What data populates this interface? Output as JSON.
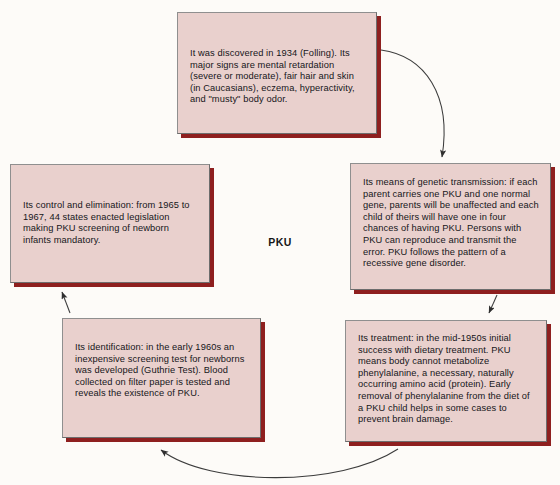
{
  "diagram": {
    "hub_label": "PKU",
    "title": "PKU",
    "type": "cycle-diagram",
    "colors": {
      "box_fill": "#e9d0cd",
      "box_shadow": "#8e1f1f",
      "box_border": "#8f8f8f",
      "background": "#fdfbf8",
      "text": "#16161a",
      "arrow": "#3a3a3a"
    },
    "nodes": [
      {
        "id": "discovery",
        "name": "discovery-box",
        "text": "It was discovered in 1934 (Folling). Its major signs are mental retardation (severe or moderate), fair hair and skin (in Caucasians), eczema, hyperactivity, and \"musty\" body odor."
      },
      {
        "id": "transmission",
        "name": "transmission-box",
        "text": "Its means of genetic transmission: if each parent carries one PKU and one normal gene, parents will be unaffected and each child of theirs will have one in four chances of having PKU. Persons with PKU can reproduce and transmit the error. PKU follows the pattern of a recessive gene disorder."
      },
      {
        "id": "treatment",
        "name": "treatment-box",
        "text": "Its treatment: in the mid-1950s initial success with dietary treatment. PKU means body cannot metabolize phenylalanine, a necessary, naturally occurring amino acid (protein). Early removal of phenylalanine from the diet of a PKU child helps in some cases to prevent brain damage."
      },
      {
        "id": "identification",
        "name": "identification-box",
        "text": "Its identification: in the early 1960s an inexpensive screening test for newborns was developed (Guthrie Test). Blood collected on filter paper is tested and reveals the existence of PKU."
      },
      {
        "id": "control",
        "name": "control-box",
        "text": "Its control and elimination: from 1965 to 1967, 44 states enacted legislation making PKU screening of newborn infants mandatory."
      }
    ],
    "arrows": [
      {
        "id": "a1",
        "from": "discovery",
        "to": "transmission",
        "shape": "curve"
      },
      {
        "id": "a2",
        "from": "transmission",
        "to": "treatment",
        "shape": "straight"
      },
      {
        "id": "a3",
        "from": "treatment",
        "to": "identification",
        "shape": "arc"
      },
      {
        "id": "a4",
        "from": "identification",
        "to": "control",
        "shape": "straight"
      }
    ]
  }
}
